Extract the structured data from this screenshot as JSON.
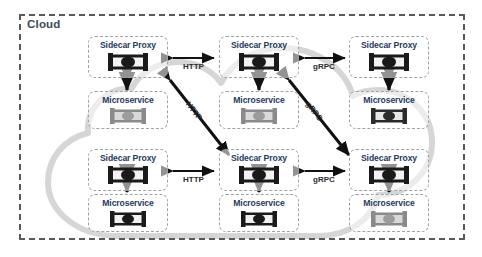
{
  "diagram": {
    "title": "Cloud",
    "boundary_label": "Cloud",
    "colors": {
      "boundary_dash": "#555a5e",
      "node_border": "#9aa3ab",
      "node_title": "#1f3a5f",
      "cloud_blob": "#d4d4d4",
      "arrow": "#111111",
      "glyph_dark": "#1a1a1a",
      "glyph_gray": "#8a8a8a"
    },
    "nodes": [
      {
        "id": "proxy-1",
        "label": "Sidecar Proxy",
        "type": "proxy",
        "icon": "server-glyph",
        "row": "top",
        "col": "left",
        "glyph_tone": "dark"
      },
      {
        "id": "proxy-2",
        "label": "Sidecar Proxy",
        "type": "proxy",
        "icon": "server-glyph",
        "row": "top",
        "col": "middle",
        "glyph_tone": "dark"
      },
      {
        "id": "proxy-3",
        "label": "Sidecar Proxy",
        "type": "proxy",
        "icon": "server-glyph",
        "row": "top",
        "col": "right",
        "glyph_tone": "dark"
      },
      {
        "id": "ms-1",
        "label": "Microservice",
        "type": "service",
        "icon": "server-glyph",
        "row": "top",
        "col": "left",
        "glyph_tone": "gray"
      },
      {
        "id": "ms-2",
        "label": "Microservice",
        "type": "service",
        "icon": "server-glyph",
        "row": "top",
        "col": "middle",
        "glyph_tone": "gray"
      },
      {
        "id": "ms-3",
        "label": "Microservice",
        "type": "service",
        "icon": "server-glyph",
        "row": "top",
        "col": "right",
        "glyph_tone": "dark"
      },
      {
        "id": "proxy-4",
        "label": "Sidecar Proxy",
        "type": "proxy",
        "icon": "server-glyph",
        "row": "bottom",
        "col": "left",
        "glyph_tone": "dark"
      },
      {
        "id": "proxy-5",
        "label": "Sidecar Proxy",
        "type": "proxy",
        "icon": "server-glyph",
        "row": "bottom",
        "col": "middle",
        "glyph_tone": "dark"
      },
      {
        "id": "proxy-6",
        "label": "Sidecar Proxy",
        "type": "proxy",
        "icon": "server-glyph",
        "row": "bottom",
        "col": "right",
        "glyph_tone": "dark"
      },
      {
        "id": "ms-4",
        "label": "Microservice",
        "type": "service",
        "icon": "server-glyph",
        "row": "bottom",
        "col": "left",
        "glyph_tone": "dark"
      },
      {
        "id": "ms-5",
        "label": "Microservice",
        "type": "service",
        "icon": "server-glyph",
        "row": "bottom",
        "col": "middle",
        "glyph_tone": "dark"
      },
      {
        "id": "ms-6",
        "label": "Microservice",
        "type": "service",
        "icon": "server-glyph",
        "row": "bottom",
        "col": "right",
        "glyph_tone": "gray"
      }
    ],
    "edges": [
      {
        "id": "e1",
        "label": "HTTP",
        "from": "proxy-1",
        "to": "proxy-2",
        "style": "double-arrow",
        "orientation": "horizontal"
      },
      {
        "id": "e2",
        "label": "gRPC",
        "from": "proxy-2",
        "to": "proxy-3",
        "style": "double-arrow",
        "orientation": "horizontal"
      },
      {
        "id": "e3",
        "label": "HTTP",
        "from": "proxy-4",
        "to": "proxy-5",
        "style": "double-arrow",
        "orientation": "horizontal"
      },
      {
        "id": "e4",
        "label": "gRPC",
        "from": "proxy-5",
        "to": "proxy-6",
        "style": "double-arrow",
        "orientation": "horizontal"
      },
      {
        "id": "e5",
        "label": "HTTP",
        "from": "proxy-1",
        "to": "proxy-5",
        "style": "double-arrow",
        "orientation": "diagonal"
      },
      {
        "id": "e6",
        "label": "gRPC",
        "from": "proxy-2",
        "to": "proxy-6",
        "style": "double-arrow",
        "orientation": "diagonal"
      },
      {
        "id": "v1",
        "label": "",
        "from": "proxy-1",
        "to": "ms-1",
        "style": "double-arrow",
        "orientation": "vertical"
      },
      {
        "id": "v2",
        "label": "",
        "from": "proxy-2",
        "to": "ms-2",
        "style": "double-arrow",
        "orientation": "vertical"
      },
      {
        "id": "v3",
        "label": "",
        "from": "proxy-3",
        "to": "ms-3",
        "style": "double-arrow",
        "orientation": "vertical"
      },
      {
        "id": "v4",
        "label": "",
        "from": "proxy-4",
        "to": "ms-4",
        "style": "double-arrow",
        "orientation": "vertical"
      },
      {
        "id": "v5",
        "label": "",
        "from": "proxy-5",
        "to": "ms-5",
        "style": "double-arrow",
        "orientation": "vertical"
      },
      {
        "id": "v6",
        "label": "",
        "from": "proxy-6",
        "to": "ms-6",
        "style": "double-arrow",
        "orientation": "vertical"
      }
    ],
    "edge_labels": {
      "http_top": "HTTP",
      "grpc_top": "gRPC",
      "http_bottom": "HTTP",
      "grpc_bottom": "gRPC",
      "http_diagonal": "HTTP",
      "grpc_diagonal": "gRPC"
    }
  }
}
